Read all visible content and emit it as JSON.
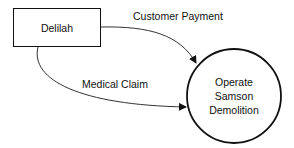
{
  "diagram": {
    "type": "data-flow-diagram",
    "external_entity": {
      "label": "Delilah"
    },
    "process": {
      "lines": [
        "Operate",
        "Samson",
        "Demolition"
      ]
    },
    "flows": [
      {
        "label": "Customer Payment",
        "from": "Delilah",
        "to": "Operate Samson Demolition"
      },
      {
        "label": "Medical Claim",
        "from": "Delilah",
        "to": "Operate Samson Demolition"
      }
    ]
  }
}
